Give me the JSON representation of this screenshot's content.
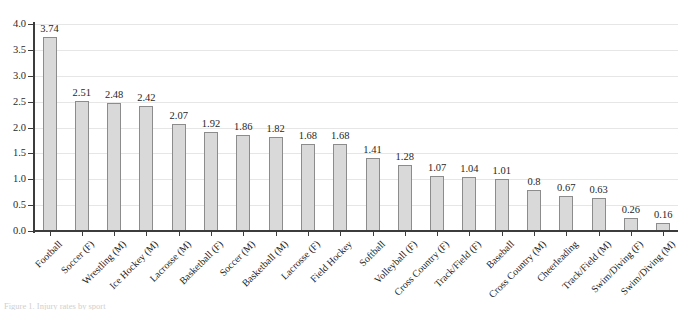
{
  "chart_data": {
    "type": "bar",
    "title": "",
    "subtitle": "",
    "xlabel": "",
    "ylabel": "",
    "ylim": [
      0,
      4.0
    ],
    "ytick_step": 0.5,
    "grid": true,
    "legend": "none",
    "bar_fill_color": "#d9d9d9",
    "bar_edge_color": "#8c8c8c",
    "gridline_color": "#e6e6e6",
    "axis_color": "#3c3c3c",
    "value_labels_shown": true,
    "categories": [
      "Football",
      "Soccer (F)",
      "Wrestling (M)",
      "Ice Hockey (M)",
      "Lacrosse (M)",
      "Basketball (F)",
      "Soccer (M)",
      "Basketball (M)",
      "Lacrosse (F)",
      "Field Hockey",
      "Softball",
      "Volleyball (F)",
      "Cross Country (F)",
      "Track/Field (F)",
      "Baseball",
      "Cross Country (M)",
      "Cheerleading",
      "Track/Field (M)",
      "Swim/Diving (F)",
      "Swim/Diving (M)"
    ],
    "values": [
      3.74,
      2.51,
      2.48,
      2.42,
      2.07,
      1.92,
      1.86,
      1.82,
      1.68,
      1.68,
      1.41,
      1.28,
      1.07,
      1.04,
      1.01,
      0.8,
      0.67,
      0.63,
      0.26,
      0.16
    ],
    "value_labels": [
      "3.74",
      "2.51",
      "2.48",
      "2.42",
      "2.07",
      "1.92",
      "1.86",
      "1.82",
      "1.68",
      "1.68",
      "1.41",
      "1.28",
      "1.07",
      "1.04",
      "1.01",
      "0.8",
      "0.67",
      "0.63",
      "0.26",
      "0.16"
    ],
    "ytick_labels": [
      "0.0",
      "0.5",
      "1.0",
      "1.5",
      "2.0",
      "2.5",
      "3.0",
      "3.5",
      "4.0"
    ],
    "ytick_values": [
      0.0,
      0.5,
      1.0,
      1.5,
      2.0,
      2.5,
      3.0,
      3.5,
      4.0
    ]
  },
  "caption": {
    "clipped_line": "Figure 1. Injury rates by sport"
  }
}
